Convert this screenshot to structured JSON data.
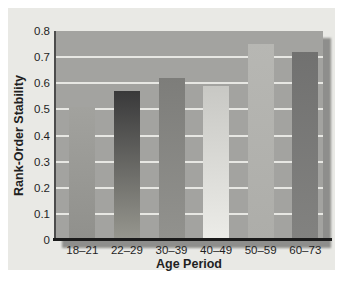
{
  "chart_data": {
    "type": "bar",
    "title": "",
    "xlabel": "Age Period",
    "ylabel": "Rank-Order Stability",
    "categories": [
      "18–21",
      "22–29",
      "30–39",
      "40–49",
      "50–59",
      "60–73"
    ],
    "values": [
      0.51,
      0.57,
      0.62,
      0.59,
      0.75,
      0.72
    ],
    "ylim": [
      0,
      0.8
    ],
    "ytick_step": 0.1,
    "yticks": [
      "0",
      "0.1",
      "0.2",
      "0.3",
      "0.4",
      "0.5",
      "0.6",
      "0.7",
      "0.8"
    ],
    "grid": "horizontal light lines at each 0.1, behind bars",
    "legend": "none"
  },
  "colors": {
    "page_bg": "#ffffff",
    "figure_bg": "#e9e9e5",
    "plot_bg": "#a3a3a0",
    "gridline": "#e7e7e3",
    "shadow": "#8e8e8c",
    "x_axis_line": "#1b1b1b",
    "y_axis_line": "#4c4c4c",
    "text": "#1f1f1f",
    "bar_gradients": [
      [
        "#a2a29e",
        "#90908c"
      ],
      [
        "#39393a",
        "#97978f"
      ],
      [
        "#7d7d7a",
        "#92928e"
      ],
      [
        "#c8c8c4",
        "#ecece8"
      ],
      [
        "#b7b7b3",
        "#adada9"
      ],
      [
        "#717170",
        "#828280"
      ]
    ]
  }
}
